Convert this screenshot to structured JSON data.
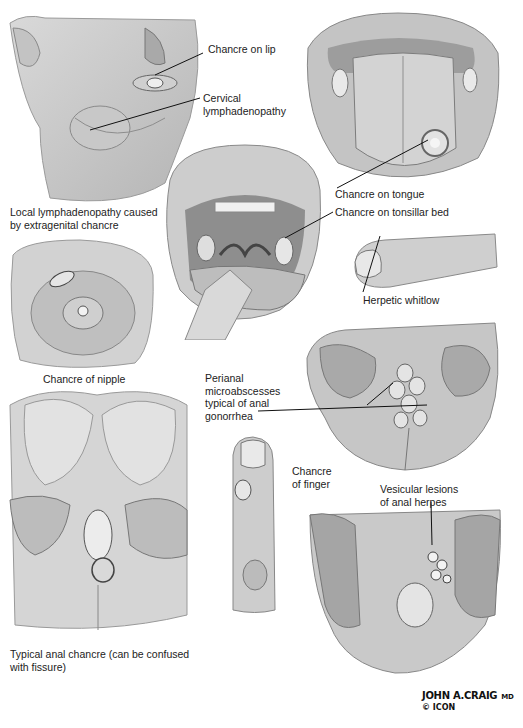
{
  "plate": {
    "panels": [
      {
        "id": "face",
        "caption": "Local lymphadenopathy caused\nby extragenital chancre"
      },
      {
        "id": "tongue",
        "caption": ""
      },
      {
        "id": "oral-cavity",
        "caption": ""
      },
      {
        "id": "nipple",
        "caption": "Chancre of nipple"
      },
      {
        "id": "thumb",
        "caption": "Herpetic whitlow"
      },
      {
        "id": "perianal-gonorrhea",
        "caption": ""
      },
      {
        "id": "anal-chancre",
        "caption": "Typical anal chancre (can be confused\nwith fissure)"
      },
      {
        "id": "finger",
        "caption": ""
      },
      {
        "id": "anal-herpes",
        "caption": ""
      }
    ],
    "labels": {
      "chancre_on_lip": "Chancre on lip",
      "cervical_lymphadenopathy": "Cervical\nlymphadenopathy",
      "local_lymphadenopathy": "Local lymphadenopathy caused\nby extragenital chancre",
      "chancre_on_tongue": "Chancre on tongue",
      "chancre_on_tonsillar_bed": "Chancre on tonsillar bed",
      "herpetic_whitlow": "Herpetic whitlow",
      "chancre_of_nipple": "Chancre of nipple",
      "perianal_microabscesses": "Perianal\nmicroabscesses\ntypical of anal\ngonorrhea",
      "chancre_of_finger": "Chancre\nof finger",
      "vesicular_lesions": "Vesicular lesions\nof anal herpes",
      "typical_anal_chancre": "Typical anal chancre (can be confused\nwith fissure)"
    },
    "signature": {
      "artist": "JOHN A.CRAIG",
      "suffix": "MD",
      "copyright": "© ICON"
    }
  }
}
